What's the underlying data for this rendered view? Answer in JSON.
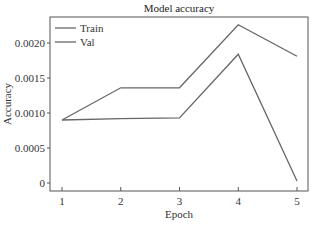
{
  "chart_data": {
    "type": "line",
    "title": "Model accuracy",
    "xlabel": "Epoch",
    "ylabel": "Accuracy",
    "x": [
      1,
      2,
      3,
      4,
      5
    ],
    "x_tick_labels": [
      "1",
      "2",
      "3",
      "4",
      "5"
    ],
    "y_ticks": [
      0,
      0.0005,
      0.001,
      0.0015,
      0.002
    ],
    "y_tick_labels": [
      "0",
      "0.0005",
      "0.0010",
      "0.0015",
      "0.0020"
    ],
    "ylim": [
      -0.00012,
      0.00236
    ],
    "xlim": [
      0.85,
      5.2
    ],
    "grid": false,
    "legend_position": "upper left",
    "series": [
      {
        "name": "Train",
        "values": [
          0.0009,
          0.00136,
          0.00136,
          0.00226,
          0.00181
        ],
        "color": "#666666"
      },
      {
        "name": "Val",
        "values": [
          0.0009,
          0.00092,
          0.00093,
          0.00184,
          3e-05
        ],
        "color": "#666666"
      }
    ]
  }
}
